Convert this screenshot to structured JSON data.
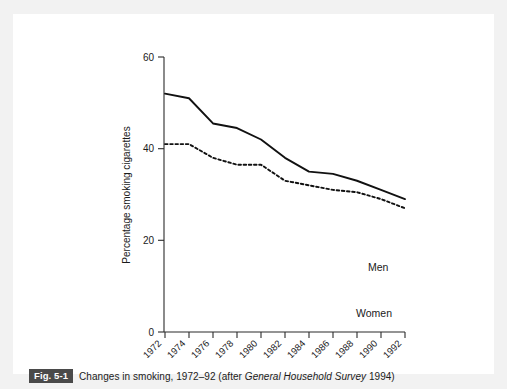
{
  "figure": {
    "tag": "Fig. 5-1",
    "caption_before": "Changes in smoking, 1972–92 (after ",
    "caption_italic": "General Household Survey",
    "caption_after": " 1994)",
    "tag_bg_color": "#4a4a4a",
    "tag_text_color": "#ffffff"
  },
  "chart_data": {
    "type": "line",
    "title": "",
    "xlabel": "",
    "ylabel": "Percentage smoking cigarettes",
    "categories": [
      "1972",
      "1974",
      "1976",
      "1978",
      "1980",
      "1982",
      "1984",
      "1986",
      "1988",
      "1990",
      "1992"
    ],
    "x": [
      1972,
      1974,
      1976,
      1978,
      1980,
      1982,
      1984,
      1986,
      1988,
      1990,
      1992
    ],
    "series": [
      {
        "name": "Men",
        "style": "solid",
        "color": "#111111",
        "values": [
          52,
          51,
          45.5,
          44.5,
          42,
          38,
          35,
          34.5,
          33,
          31,
          29
        ]
      },
      {
        "name": "Women",
        "style": "dotted",
        "color": "#111111",
        "values": [
          41,
          41,
          38,
          36.5,
          36.5,
          33,
          32,
          31,
          30.5,
          29,
          27
        ]
      }
    ],
    "ylim": [
      0,
      60
    ],
    "yticks": [
      0,
      20,
      40,
      60
    ],
    "ytick_labels": [
      "0",
      "20",
      "40",
      "60"
    ],
    "grid": false,
    "legend": "inline-labels",
    "xtick_rotation": -45
  }
}
